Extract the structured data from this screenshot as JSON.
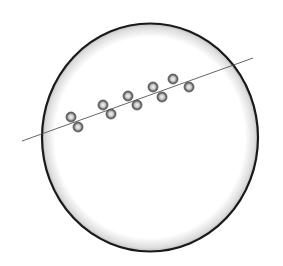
{
  "diagram": {
    "colors": {
      "background": "#ffffff",
      "circle_stroke": "#1a1a1a",
      "line": "#555555",
      "particle_edge": "#5a5a5a",
      "particle_center": "#e6e6e6"
    },
    "circle": {
      "cx": 150,
      "cy": 137.5,
      "rx": 108,
      "ry": 114
    },
    "line": {
      "x1": 22,
      "y1": 141,
      "x2": 253,
      "y2": 58
    },
    "particles": [
      {
        "x": 71,
        "y": 117
      },
      {
        "x": 78,
        "y": 127
      },
      {
        "x": 103,
        "y": 105
      },
      {
        "x": 111,
        "y": 114
      },
      {
        "x": 128,
        "y": 96
      },
      {
        "x": 137,
        "y": 105
      },
      {
        "x": 153,
        "y": 87
      },
      {
        "x": 162,
        "y": 97
      },
      {
        "x": 173,
        "y": 79
      },
      {
        "x": 189,
        "y": 87
      }
    ],
    "particle_radius": 5
  }
}
